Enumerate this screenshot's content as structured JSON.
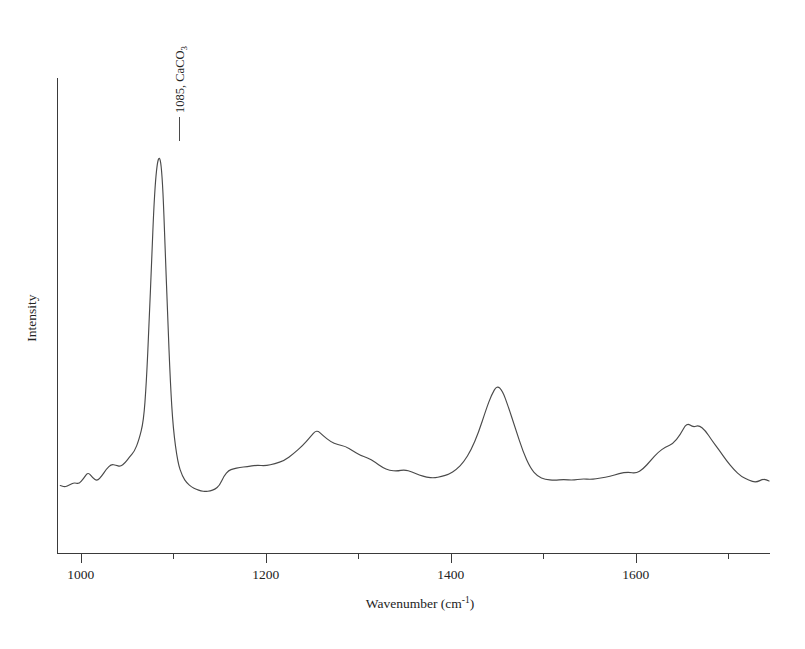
{
  "chart_data": {
    "type": "line",
    "title": "",
    "subtitle": "",
    "xlabel": "Wavenumber (cm",
    "xlabel_superscript": "-1",
    "xlabel_close": ")",
    "ylabel": "Intensity",
    "xlim": [
      975,
      1745
    ],
    "ylim": [
      0,
      100
    ],
    "grid": false,
    "legend": false,
    "x_major_ticks": [
      1000,
      1200,
      1400,
      1600
    ],
    "x_major_tick_labels": [
      "1000",
      "1200",
      "1400",
      "1600"
    ],
    "x_minor_ticks": [
      1100,
      1300,
      1500,
      1700
    ],
    "y_ticks": [],
    "y_tick_labels": [],
    "annotations": [
      {
        "name": "peak-1085",
        "text": "1085, CaCO",
        "subscript": "3",
        "x": 1085,
        "y": 97,
        "rotation": -90,
        "leader": true
      }
    ],
    "series": [
      {
        "name": "spectrum",
        "color": "#4a4a4a",
        "x": [
          978,
          983,
          988,
          993,
          998,
          1003,
          1008,
          1013,
          1018,
          1023,
          1028,
          1033,
          1038,
          1043,
          1048,
          1053,
          1058,
          1063,
          1068,
          1071,
          1074,
          1077,
          1079,
          1081,
          1083,
          1085,
          1087,
          1089,
          1091,
          1094,
          1097,
          1100,
          1105,
          1110,
          1115,
          1120,
          1125,
          1130,
          1135,
          1140,
          1145,
          1150,
          1155,
          1160,
          1165,
          1172,
          1180,
          1190,
          1200,
          1210,
          1220,
          1230,
          1240,
          1248,
          1255,
          1262,
          1270,
          1278,
          1286,
          1294,
          1302,
          1310,
          1318,
          1326,
          1334,
          1342,
          1350,
          1358,
          1366,
          1374,
          1382,
          1390,
          1398,
          1406,
          1414,
          1422,
          1430,
          1438,
          1444,
          1450,
          1456,
          1462,
          1470,
          1478,
          1486,
          1494,
          1502,
          1512,
          1522,
          1532,
          1542,
          1552,
          1562,
          1572,
          1582,
          1592,
          1600,
          1608,
          1616,
          1624,
          1632,
          1640,
          1648,
          1655,
          1662,
          1668,
          1675,
          1682,
          1690,
          1698,
          1706,
          1714,
          1722,
          1730,
          1738,
          1744
        ],
        "y": [
          7.0,
          6.6,
          7.2,
          7.8,
          7.4,
          8.8,
          10.6,
          9.0,
          8.2,
          9.6,
          11.4,
          12.6,
          12.4,
          12.0,
          13.0,
          14.6,
          16.0,
          19.0,
          24.0,
          34.0,
          50.0,
          68.0,
          80.0,
          88.0,
          92.5,
          94.0,
          92.0,
          85.0,
          72.0,
          52.0,
          34.0,
          22.0,
          13.0,
          9.4,
          7.6,
          6.6,
          6.0,
          5.6,
          5.4,
          5.6,
          6.0,
          7.0,
          9.6,
          11.0,
          11.4,
          11.8,
          12.0,
          12.4,
          12.2,
          12.8,
          13.6,
          15.4,
          17.6,
          19.8,
          21.8,
          20.2,
          18.6,
          17.8,
          17.4,
          16.2,
          15.0,
          14.4,
          13.2,
          11.8,
          11.0,
          10.8,
          11.2,
          10.6,
          9.8,
          9.2,
          9.0,
          9.4,
          10.0,
          11.2,
          13.2,
          16.4,
          21.0,
          27.0,
          31.0,
          33.5,
          32.0,
          28.0,
          22.0,
          16.0,
          11.6,
          9.4,
          8.6,
          8.4,
          8.6,
          8.4,
          8.8,
          8.6,
          9.0,
          9.4,
          10.2,
          10.6,
          10.2,
          11.4,
          13.6,
          15.8,
          17.2,
          18.0,
          20.4,
          23.6,
          22.4,
          23.0,
          21.6,
          19.0,
          16.4,
          13.6,
          11.2,
          9.4,
          8.4,
          7.8,
          8.8,
          8.2
        ]
      }
    ]
  },
  "figure": {
    "background_color": "#ffffff",
    "line_color": "#4a4a4a",
    "axis_color": "#3a3a3a",
    "text_color": "#232323"
  }
}
